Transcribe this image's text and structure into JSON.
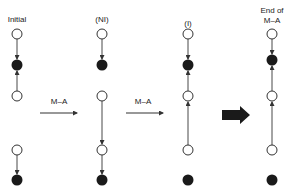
{
  "labels": {
    "initial": "Initial",
    "ni": "(NI)",
    "i": "(I)",
    "end_line1": "End of",
    "end_line2": "M–A"
  },
  "transitions": {
    "first": "M–A",
    "second": "M–A"
  },
  "colors": {
    "stroke": "#333333",
    "filled": "#1a1a1a",
    "open": "#ffffff",
    "background": "#ffffff"
  },
  "diagram": {
    "columns": [
      {
        "name": "Initial",
        "x": 17,
        "nodes": [
          {
            "y": 34,
            "type": "open"
          },
          {
            "y": 65,
            "type": "filled"
          },
          {
            "y": 96,
            "type": "open"
          },
          {
            "y": 150,
            "type": "open"
          },
          {
            "y": 180,
            "type": "filled"
          }
        ]
      },
      {
        "name": "(NI)",
        "x": 102,
        "nodes": [
          {
            "y": 34,
            "type": "open"
          },
          {
            "y": 65,
            "type": "filled"
          },
          {
            "y": 96,
            "type": "open"
          },
          {
            "y": 150,
            "type": "open"
          },
          {
            "y": 180,
            "type": "filled"
          }
        ]
      },
      {
        "name": "(I)",
        "x": 188,
        "nodes": [
          {
            "y": 34,
            "type": "open"
          },
          {
            "y": 65,
            "type": "filled"
          },
          {
            "y": 96,
            "type": "open"
          },
          {
            "y": 150,
            "type": "open"
          },
          {
            "y": 180,
            "type": "filled"
          }
        ]
      },
      {
        "name": "End of M–A",
        "x": 272,
        "nodes": [
          {
            "y": 34,
            "type": "open"
          },
          {
            "y": 60,
            "type": "filled"
          },
          {
            "y": 96,
            "type": "open"
          },
          {
            "y": 150,
            "type": "open"
          },
          {
            "y": 180,
            "type": "filled"
          }
        ]
      }
    ]
  }
}
